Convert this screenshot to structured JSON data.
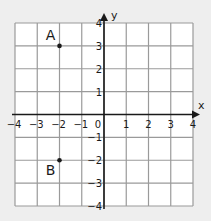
{
  "diagram": {
    "type": "coordinate-grid",
    "x_axis_label": "x",
    "y_axis_label": "y",
    "x_range": [
      -4,
      4
    ],
    "y_range": [
      -4,
      4
    ],
    "x_ticks": [
      "-4",
      "-3",
      "-2",
      "-1",
      "1",
      "2",
      "3",
      "4"
    ],
    "y_ticks": [
      "4",
      "3",
      "2",
      "1",
      "-1",
      "-2",
      "-3",
      "-4"
    ],
    "origin_label": "0",
    "points": [
      {
        "label": "A",
        "x": -2,
        "y": 3
      },
      {
        "label": "B",
        "x": -2,
        "y": -2
      }
    ],
    "colors": {
      "background": "#eeeeee",
      "grid_fill": "#ffffff",
      "grid_line": "#9a9a9a",
      "axis": "#1a1a1a",
      "text": "#1a1a1a"
    }
  }
}
